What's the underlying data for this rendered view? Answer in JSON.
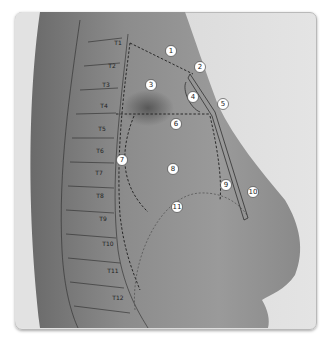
{
  "figure": {
    "type": "anatomical-diagram",
    "frame_color": "#b9b9b9",
    "line_color": "#222222"
  },
  "vertebrae": [
    {
      "label": "T1"
    },
    {
      "label": "T2"
    },
    {
      "label": "T3"
    },
    {
      "label": "T4"
    },
    {
      "label": "T5"
    },
    {
      "label": "T6"
    },
    {
      "label": "T7"
    },
    {
      "label": "T8"
    },
    {
      "label": "T9"
    },
    {
      "label": "T10"
    },
    {
      "label": "T11"
    },
    {
      "label": "T12"
    }
  ],
  "markers": [
    {
      "label": "1"
    },
    {
      "label": "2"
    },
    {
      "label": "3"
    },
    {
      "label": "4"
    },
    {
      "label": "5"
    },
    {
      "label": "6"
    },
    {
      "label": "7"
    },
    {
      "label": "8"
    },
    {
      "label": "9"
    },
    {
      "label": "10"
    },
    {
      "label": "11"
    }
  ]
}
